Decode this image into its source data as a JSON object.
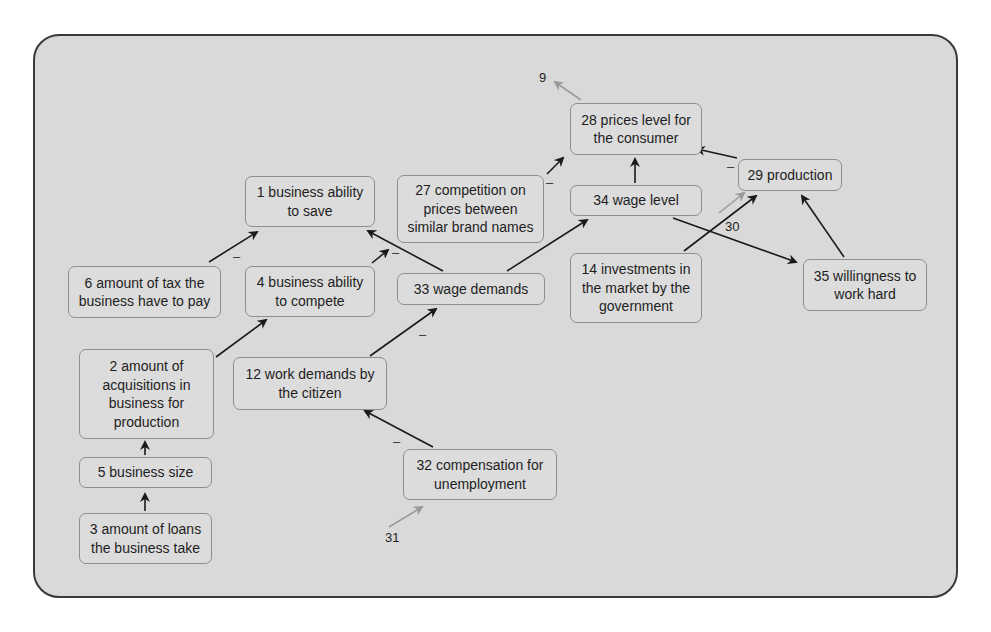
{
  "diagram": {
    "type": "causal-loop-diagram",
    "nodes": [
      {
        "id": "1",
        "label": "1 business ability to save"
      },
      {
        "id": "27",
        "label": "27 competition on prices between similar brand names"
      },
      {
        "id": "6",
        "label": "6 amount of tax the business have to pay"
      },
      {
        "id": "4",
        "label": "4 business ability to compete"
      },
      {
        "id": "33",
        "label": "33 wage demands"
      },
      {
        "id": "2",
        "label": "2 amount of acquisitions in business for production"
      },
      {
        "id": "12",
        "label": "12 work demands by the citizen"
      },
      {
        "id": "5",
        "label": "5 business size"
      },
      {
        "id": "3",
        "label": "3 amount of loans the business take"
      },
      {
        "id": "32",
        "label": "32 compensation for unemployment"
      },
      {
        "id": "28",
        "label": "28 prices level for the consumer"
      },
      {
        "id": "34",
        "label": "34 wage level"
      },
      {
        "id": "29",
        "label": "29 production"
      },
      {
        "id": "14",
        "label": "14 investments in the market by the government"
      },
      {
        "id": "35",
        "label": "35 willingness to work hard"
      }
    ],
    "external_labels": {
      "ext_9": "9",
      "ext_30": "30",
      "ext_31": "31"
    },
    "polarity": {
      "negative": "–"
    },
    "edges": [
      {
        "from": "6",
        "to": "1",
        "polarity": "-"
      },
      {
        "from": "4",
        "to": "1",
        "polarity": "+"
      },
      {
        "from": "33",
        "to": "1",
        "polarity": "-"
      },
      {
        "from": "2",
        "to": "4",
        "polarity": "+"
      },
      {
        "from": "5",
        "to": "2",
        "polarity": "+"
      },
      {
        "from": "3",
        "to": "5",
        "polarity": "+"
      },
      {
        "from": "12",
        "to": "33",
        "polarity": "-"
      },
      {
        "from": "32",
        "to": "12",
        "polarity": "-"
      },
      {
        "from": "31",
        "to": "32",
        "polarity": "+",
        "external": true
      },
      {
        "from": "33",
        "to": "34",
        "polarity": "+"
      },
      {
        "from": "27",
        "to": "28",
        "polarity": "-"
      },
      {
        "from": "34",
        "to": "28",
        "polarity": "+"
      },
      {
        "from": "29",
        "to": "28",
        "polarity": "-"
      },
      {
        "from": "28",
        "to": "9",
        "polarity": "+",
        "external": true
      },
      {
        "from": "14",
        "to": "29",
        "polarity": "+"
      },
      {
        "from": "30",
        "to": "29",
        "polarity": "+",
        "external": true
      },
      {
        "from": "34",
        "to": "35",
        "polarity": "+"
      },
      {
        "from": "35",
        "to": "29",
        "polarity": "+"
      }
    ]
  }
}
